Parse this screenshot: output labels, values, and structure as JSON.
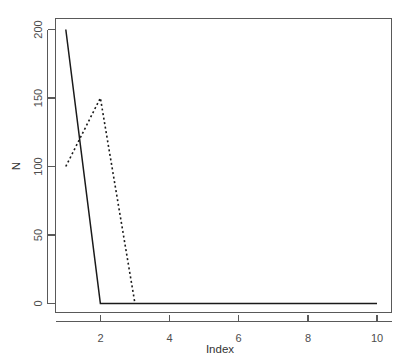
{
  "chart_data": {
    "type": "line",
    "title": "",
    "subtitle": "",
    "xlabel": "Index",
    "ylabel": "N",
    "xlim": [
      1,
      10
    ],
    "ylim": [
      0,
      200
    ],
    "grid": false,
    "legend": null,
    "x_ticks": [
      2,
      4,
      6,
      8,
      10
    ],
    "x_tick_labels": [
      "2",
      "4",
      "6",
      "8",
      "10"
    ],
    "y_ticks": [
      0,
      50,
      100,
      150,
      200
    ],
    "y_tick_labels": [
      "0",
      "50",
      "100",
      "150",
      "200"
    ],
    "x": [
      1,
      2,
      3,
      4,
      5,
      6,
      7,
      8,
      9,
      10
    ],
    "series": [
      {
        "name": "solid-series",
        "style": "solid",
        "color": "#1a1a1a",
        "x": [
          1,
          2,
          3,
          4,
          5,
          6,
          7,
          8,
          9,
          10
        ],
        "values": [
          200,
          0,
          0,
          0,
          0,
          0,
          0,
          0,
          0,
          0
        ]
      },
      {
        "name": "dashed-series",
        "style": "dashed",
        "color": "#1a1a1a",
        "x": [
          1,
          2,
          3
        ],
        "values": [
          100,
          150,
          0
        ]
      }
    ],
    "annotations": []
  },
  "axes": {
    "y_axis_label": "N",
    "x_axis_label": "Index",
    "axis_color": "#595959",
    "tick_label_color": "#4d4d4d"
  },
  "ticks": {
    "y": [
      {
        "label": "200",
        "value": 200
      },
      {
        "label": "150",
        "value": 150
      },
      {
        "label": "100",
        "value": 100
      },
      {
        "label": "50",
        "value": 50
      },
      {
        "label": "0",
        "value": 0
      }
    ],
    "x": [
      {
        "label": "2",
        "value": 2
      },
      {
        "label": "4",
        "value": 4
      },
      {
        "label": "6",
        "value": 6
      },
      {
        "label": "8",
        "value": 8
      },
      {
        "label": "10",
        "value": 10
      }
    ]
  }
}
